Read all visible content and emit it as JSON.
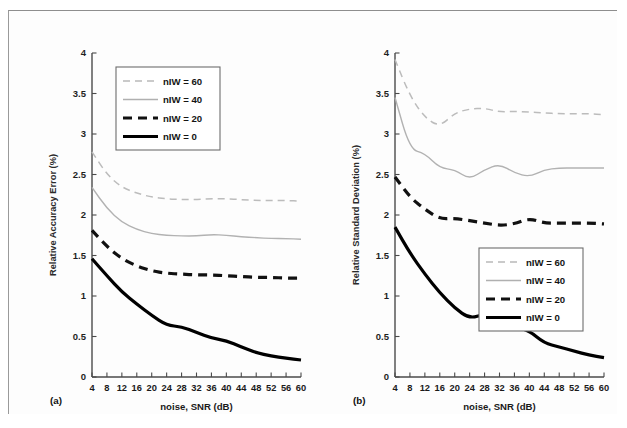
{
  "figure": {
    "panels": [
      {
        "caption": "(a)",
        "xlabel": "noise, SNR (dB)",
        "ylabel": "Relative Accuracy Error (%)",
        "legend_position": "top-left"
      },
      {
        "caption": "(b)",
        "xlabel": "noise, SNR (dB)",
        "ylabel": "Relative Standard Deviation (%)",
        "legend_position": "middle-right"
      }
    ],
    "legend_entries": [
      {
        "label": "nIW = 60",
        "color": "#b9b9b9",
        "style": "dashed-light"
      },
      {
        "label": "nIW = 40",
        "color": "#b0b0b0",
        "style": "solid-light"
      },
      {
        "label": "nIW = 20",
        "color": "#111111",
        "style": "dashed-bold"
      },
      {
        "label": "nIW = 0",
        "color": "#000000",
        "style": "solid-bold"
      }
    ]
  },
  "chart_data": [
    {
      "type": "line",
      "title": "",
      "panel": "(a)",
      "xlabel": "noise, SNR (dB)",
      "ylabel": "Relative Accuracy Error (%)",
      "xlim": [
        4,
        60
      ],
      "ylim": [
        0,
        4
      ],
      "yticks": [
        0,
        0.5,
        1,
        1.5,
        2,
        2.5,
        3,
        3.5,
        4
      ],
      "xticks": [
        4,
        8,
        12,
        16,
        20,
        24,
        28,
        32,
        36,
        40,
        44,
        48,
        52,
        56,
        60
      ],
      "grid": false,
      "legend": [
        "nIW = 60",
        "nIW = 40",
        "nIW = 20",
        "nIW = 0"
      ],
      "x": [
        4,
        8,
        12,
        16,
        20,
        24,
        28,
        32,
        36,
        40,
        44,
        48,
        52,
        56,
        60
      ],
      "series": [
        {
          "name": "nIW = 60",
          "color": "#bcbcbc",
          "style": "dashed-light",
          "values": [
            2.78,
            2.5,
            2.34,
            2.27,
            2.22,
            2.2,
            2.19,
            2.19,
            2.2,
            2.2,
            2.19,
            2.18,
            2.18,
            2.18,
            2.17
          ]
        },
        {
          "name": "nIW = 40",
          "color": "#b2b2b2",
          "style": "solid-light",
          "values": [
            2.34,
            2.08,
            1.91,
            1.82,
            1.77,
            1.75,
            1.74,
            1.74,
            1.76,
            1.75,
            1.73,
            1.72,
            1.71,
            1.71,
            1.7
          ]
        },
        {
          "name": "nIW = 20",
          "color": "#111111",
          "style": "dashed-bold",
          "values": [
            1.81,
            1.61,
            1.46,
            1.37,
            1.31,
            1.28,
            1.27,
            1.26,
            1.26,
            1.25,
            1.24,
            1.23,
            1.23,
            1.22,
            1.22
          ]
        },
        {
          "name": "nIW = 0",
          "color": "#000000",
          "style": "solid-bold",
          "values": [
            1.46,
            1.25,
            1.05,
            0.9,
            0.76,
            0.64,
            0.62,
            0.55,
            0.48,
            0.45,
            0.37,
            0.3,
            0.26,
            0.23,
            0.21
          ]
        }
      ]
    },
    {
      "type": "line",
      "title": "",
      "panel": "(b)",
      "xlabel": "noise, SNR (dB)",
      "ylabel": "Relative Standard Deviation (%)",
      "xlim": [
        4,
        60
      ],
      "ylim": [
        0,
        4
      ],
      "yticks": [
        0,
        0.5,
        1,
        1.5,
        2,
        2.5,
        3,
        3.5,
        4
      ],
      "xticks": [
        4,
        8,
        12,
        16,
        20,
        24,
        28,
        32,
        36,
        40,
        44,
        48,
        52,
        56,
        60
      ],
      "grid": false,
      "legend": [
        "nIW = 60",
        "nIW = 40",
        "nIW = 20",
        "nIW = 0"
      ],
      "x": [
        4,
        8,
        12,
        16,
        20,
        24,
        28,
        32,
        36,
        40,
        44,
        48,
        52,
        56,
        60
      ],
      "series": [
        {
          "name": "nIW = 60",
          "color": "#bcbcbc",
          "style": "dashed-light",
          "values": [
            3.92,
            3.47,
            3.2,
            3.09,
            3.26,
            3.31,
            3.32,
            3.27,
            3.28,
            3.27,
            3.26,
            3.25,
            3.25,
            3.25,
            3.24
          ]
        },
        {
          "name": "nIW = 40",
          "color": "#b2b2b2",
          "style": "solid-light",
          "values": [
            3.45,
            2.81,
            2.76,
            2.58,
            2.56,
            2.44,
            2.56,
            2.63,
            2.52,
            2.47,
            2.56,
            2.58,
            2.58,
            2.58,
            2.58
          ]
        },
        {
          "name": "nIW = 20",
          "color": "#111111",
          "style": "dashed-bold",
          "values": [
            2.47,
            2.22,
            2.07,
            1.95,
            1.96,
            1.93,
            1.9,
            1.87,
            1.89,
            1.96,
            1.9,
            1.9,
            1.9,
            1.9,
            1.89
          ]
        },
        {
          "name": "nIW = 0",
          "color": "#000000",
          "style": "solid-bold",
          "values": [
            1.85,
            1.53,
            1.27,
            1.04,
            0.85,
            0.72,
            0.78,
            0.69,
            0.62,
            0.57,
            0.42,
            0.37,
            0.32,
            0.27,
            0.24
          ]
        }
      ]
    }
  ]
}
